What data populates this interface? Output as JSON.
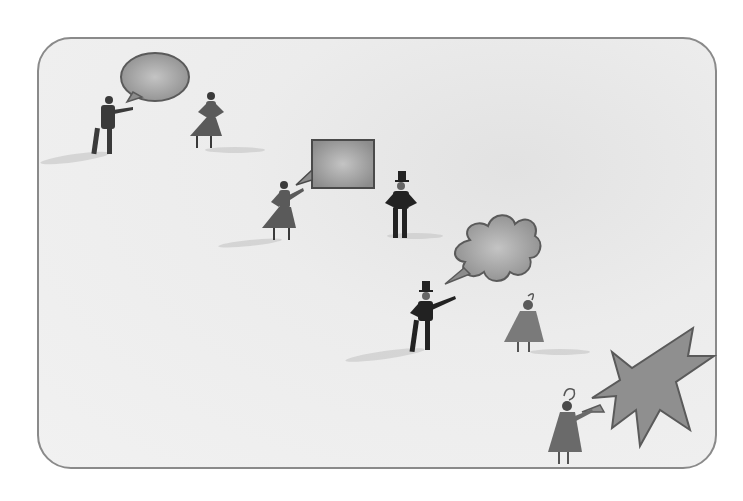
{
  "illustration": {
    "description": "Grayscale illustration of people conversing on an open plain, each speaking into a differently shaped speech bubble",
    "colors": {
      "background": "#efefef",
      "border": "#8a8a8a",
      "figure_dark": "#2a2a2a",
      "figure_mid": "#5a5a5a",
      "bubble_fill": "#a9a9a9",
      "bubble_dark": "#7c7c7c",
      "shadow": "#cfcfcf"
    },
    "scenes": [
      {
        "speaker": "man in suit",
        "bubble": "round speech bubble",
        "listener": "woman in skirt"
      },
      {
        "speaker": "woman in skirt",
        "bubble": "rectangular speech bubble",
        "listener": "man in top hat"
      },
      {
        "speaker": "man in top hat",
        "bubble": "cloud thought bubble",
        "listener": "woman with feathered hat"
      },
      {
        "speaker": "woman with feathered hat",
        "bubble": "spiky burst bubble",
        "listener": ""
      }
    ]
  }
}
